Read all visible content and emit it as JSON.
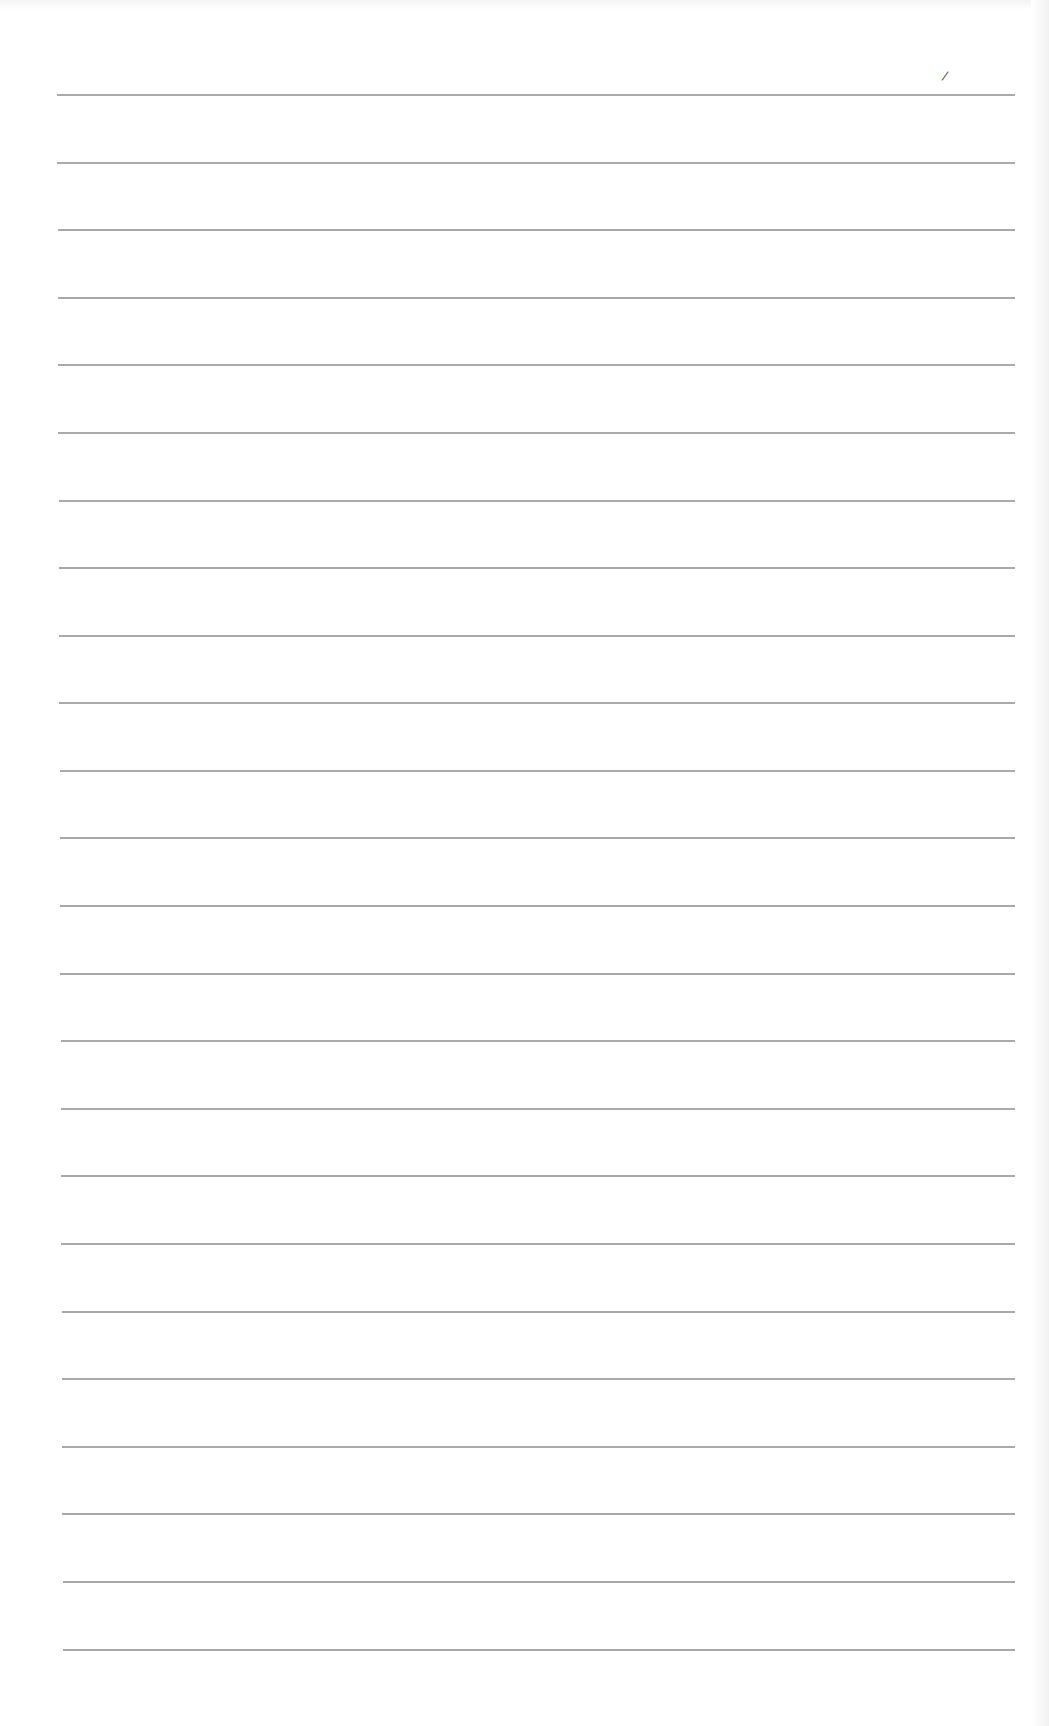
{
  "page": {
    "type": "lined-paper",
    "background": "#ffffff",
    "line_color": "#9a9a9a",
    "line_count": 24,
    "first_line_y": 94,
    "last_line_y": 1652,
    "line_left_start": 57,
    "line_left_end": 63,
    "line_right": 1015,
    "mark": "/"
  }
}
